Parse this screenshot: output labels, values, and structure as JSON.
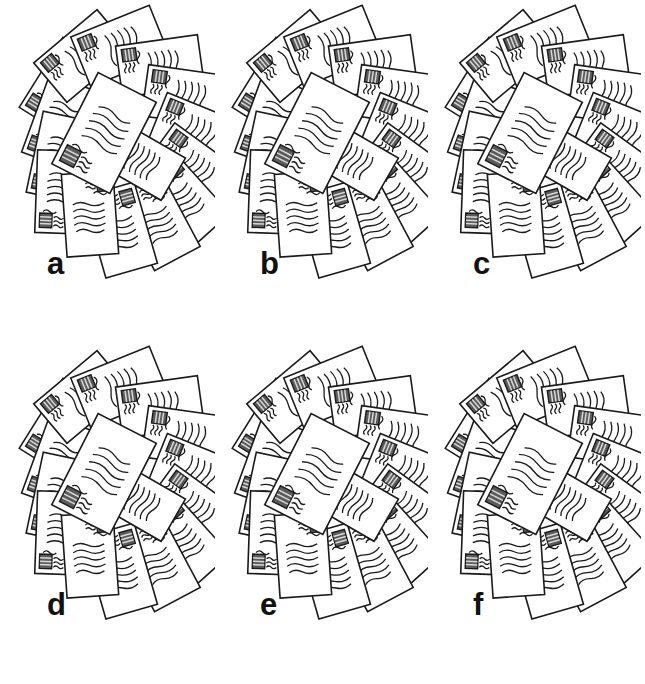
{
  "figure": {
    "kind": "scientific-figure-panel-grid",
    "width": 645,
    "height": 684,
    "background_color": "#ffffff",
    "rows": 2,
    "columns": 3,
    "line_color": "#1a1a1a",
    "stamp_color": "#555555",
    "envelope_fill": "#ffffff"
  },
  "panels": [
    {
      "id": "a",
      "label": "a",
      "label_x": 47,
      "label_y": 248,
      "origin_x": 0,
      "origin_y": 0,
      "envelope_count": 16,
      "description": "radial fan pile of stamped envelopes"
    },
    {
      "id": "b",
      "label": "b",
      "label_x": 47,
      "label_y": 248,
      "origin_x": 213,
      "origin_y": 0,
      "envelope_count": 16,
      "description": "radial fan pile of stamped envelopes"
    },
    {
      "id": "c",
      "label": "c",
      "label_x": 47,
      "label_y": 248,
      "origin_x": 426,
      "origin_y": 0,
      "envelope_count": 16,
      "description": "radial fan pile of stamped envelopes"
    },
    {
      "id": "d",
      "label": "d",
      "label_x": 47,
      "label_y": 248,
      "origin_x": 0,
      "origin_y": 341,
      "envelope_count": 16,
      "description": "radial fan pile of stamped envelopes"
    },
    {
      "id": "e",
      "label": "e",
      "label_x": 47,
      "label_y": 248,
      "origin_x": 213,
      "origin_y": 341,
      "envelope_count": 16,
      "description": "radial fan pile of stamped envelopes"
    },
    {
      "id": "f",
      "label": "f",
      "label_x": 47,
      "label_y": 248,
      "origin_x": 426,
      "origin_y": 341,
      "envelope_count": 16,
      "description": "radial fan pile of stamped envelopes"
    }
  ],
  "envelope_layout": [
    {
      "cx": 63,
      "cy": 86,
      "w": 84,
      "h": 53,
      "rot": -58,
      "z": 1
    },
    {
      "cx": 60,
      "cy": 122,
      "w": 84,
      "h": 53,
      "rot": -70,
      "z": 2
    },
    {
      "cx": 60,
      "cy": 157,
      "w": 84,
      "h": 53,
      "rot": -78,
      "z": 3
    },
    {
      "cx": 62,
      "cy": 192,
      "w": 84,
      "h": 53,
      "rot": -88,
      "z": 4
    },
    {
      "cx": 82,
      "cy": 56,
      "w": 84,
      "h": 53,
      "rot": -40,
      "z": 5
    },
    {
      "cx": 120,
      "cy": 46,
      "w": 86,
      "h": 55,
      "rot": -22,
      "z": 6
    },
    {
      "cx": 160,
      "cy": 66,
      "w": 84,
      "h": 53,
      "rot": -8,
      "z": 7
    },
    {
      "cx": 186,
      "cy": 96,
      "w": 84,
      "h": 53,
      "rot": 8,
      "z": 8
    },
    {
      "cx": 196,
      "cy": 132,
      "w": 84,
      "h": 53,
      "rot": 22,
      "z": 9
    },
    {
      "cx": 193,
      "cy": 168,
      "w": 84,
      "h": 53,
      "rot": 36,
      "z": 10
    },
    {
      "cx": 183,
      "cy": 200,
      "w": 84,
      "h": 53,
      "rot": 48,
      "z": 11
    },
    {
      "cx": 158,
      "cy": 222,
      "w": 84,
      "h": 53,
      "rot": 62,
      "z": 12
    },
    {
      "cx": 120,
      "cy": 230,
      "w": 86,
      "h": 55,
      "rot": 74,
      "z": 13
    },
    {
      "cx": 90,
      "cy": 214,
      "w": 84,
      "h": 53,
      "rot": 86,
      "z": 14
    },
    {
      "cx": 140,
      "cy": 160,
      "w": 78,
      "h": 50,
      "rot": 30,
      "z": 15
    },
    {
      "cx": 104,
      "cy": 133,
      "w": 104,
      "h": 67,
      "rot": -63,
      "z": 16
    }
  ],
  "envelope_parts": {
    "stamp": "postage-stamp",
    "cancellation": "wavy-cancellation-lines",
    "address": "wavy-address-lines",
    "address_line_count": 5
  }
}
